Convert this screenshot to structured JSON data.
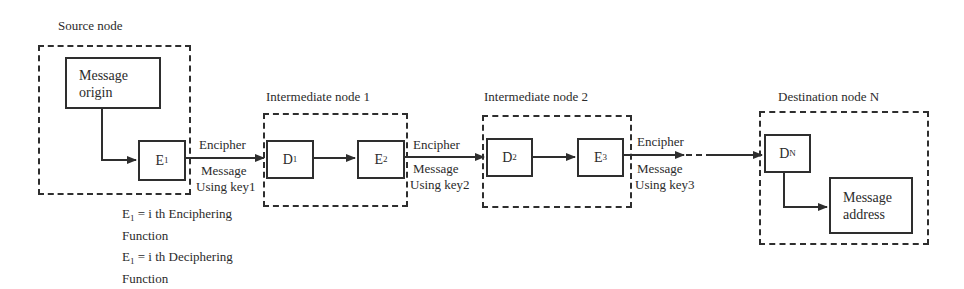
{
  "diagram": {
    "title_labels": {
      "source": "Source node",
      "intermediate1": "Intermediate node 1",
      "intermediate2": "Intermediate node 2",
      "destination": "Destination node N"
    },
    "boxes": {
      "message_origin": [
        "Message",
        "origin"
      ],
      "e1": {
        "base": "E",
        "sub": "1"
      },
      "d1": {
        "base": "D",
        "sub": "1"
      },
      "e2": {
        "base": "E",
        "sub": "2"
      },
      "d2": {
        "base": "D",
        "sub": "2"
      },
      "e3": {
        "base": "E",
        "sub": "3"
      },
      "dn": {
        "base": "D",
        "sub": "N"
      },
      "message_address": [
        "Message",
        "address"
      ]
    },
    "links": [
      {
        "top": "Encipher",
        "bottom1": "Message",
        "bottom2": "Using key1"
      },
      {
        "top": "Encipher",
        "bottom1": "Message",
        "bottom2": "Using key2"
      },
      {
        "top": "Encipher",
        "bottom1": "Message",
        "bottom2": "Using key3"
      }
    ],
    "legend": [
      {
        "base": "E",
        "sub": "1",
        "text": " = i th Enciphering",
        "line2": "Function"
      },
      {
        "base": "E",
        "sub": "1",
        "text": " = i th Deciphering",
        "line2": "Function"
      }
    ],
    "colors": {
      "line": "#2e2e2e",
      "text": "#2b2b2b",
      "background": "#ffffff"
    }
  }
}
